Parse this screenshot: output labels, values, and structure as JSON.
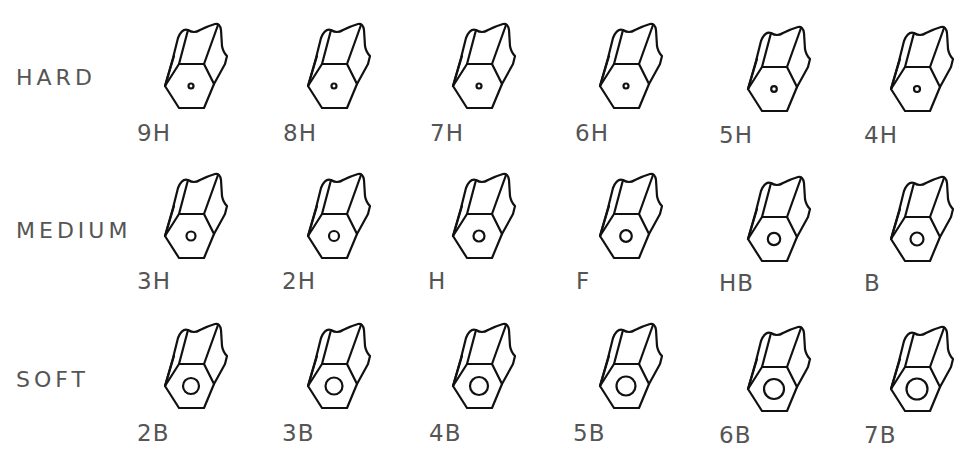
{
  "rows": [
    {
      "label": "HARD",
      "grades": [
        {
          "label": "9H",
          "lead_radius": 2.5
        },
        {
          "label": "8H",
          "lead_radius": 2.5
        },
        {
          "label": "7H",
          "lead_radius": 2.5
        },
        {
          "label": "6H",
          "lead_radius": 2.5
        },
        {
          "label": "5H",
          "lead_radius": 2.8
        },
        {
          "label": "4H",
          "lead_radius": 3.0
        }
      ]
    },
    {
      "label": "MEDIUM",
      "grades": [
        {
          "label": "3H",
          "lead_radius": 4.5
        },
        {
          "label": "2H",
          "lead_radius": 5
        },
        {
          "label": "H",
          "lead_radius": 5.5
        },
        {
          "label": "F",
          "lead_radius": 5.8
        },
        {
          "label": "HB",
          "lead_radius": 6.2
        },
        {
          "label": "B",
          "lead_radius": 6.5
        }
      ]
    },
    {
      "label": "SOFT",
      "grades": [
        {
          "label": "2B",
          "lead_radius": 8
        },
        {
          "label": "3B",
          "lead_radius": 8.5
        },
        {
          "label": "4B",
          "lead_radius": 9
        },
        {
          "label": "5B",
          "lead_radius": 9.5
        },
        {
          "label": "6B",
          "lead_radius": 10
        },
        {
          "label": "7B",
          "lead_radius": 10.5
        }
      ]
    }
  ],
  "colors": {
    "stroke": "#111111",
    "text": "#555555",
    "background": "#ffffff"
  }
}
